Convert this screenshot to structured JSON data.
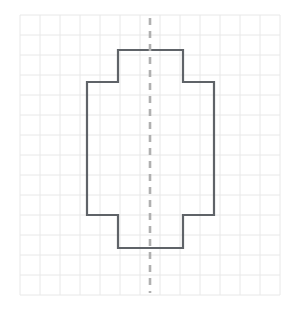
{
  "page": {
    "background_color": "#ffffff",
    "width": 293,
    "height": 309
  },
  "grid": {
    "name": "graph-paper-grid",
    "origin_x": 20,
    "origin_y": 15,
    "cell_size": 20,
    "columns": 13,
    "rows": 14,
    "line_color": "#e8e8e8",
    "line_width": 1,
    "right_x": 280,
    "bottom_y": 295
  },
  "symmetry_line": {
    "name": "vertical-line-of-symmetry",
    "orientation": "vertical",
    "x": 150,
    "y_start": 18,
    "y_end": 293,
    "color": "#b0b0b0",
    "line_width": 2.6,
    "dash_pattern": "7 6"
  },
  "figure": {
    "name": "cross-shaped-polygon",
    "stroke_color": "#5f6368",
    "stroke_width": 2.2,
    "fill": "none",
    "vertex_count": 12,
    "axis_x": 150,
    "bounds": {
      "left": 87,
      "right": 214,
      "top": 50,
      "bottom": 248
    },
    "points": "118,50 183,50 183,82 214,82 214,215 183,215 183,248 118,248 118,215 87,215 87,82 118,82",
    "vertices": [
      {
        "x": 118,
        "y": 50
      },
      {
        "x": 183,
        "y": 50
      },
      {
        "x": 183,
        "y": 82
      },
      {
        "x": 214,
        "y": 82
      },
      {
        "x": 214,
        "y": 215
      },
      {
        "x": 183,
        "y": 215
      },
      {
        "x": 183,
        "y": 248
      },
      {
        "x": 118,
        "y": 248
      },
      {
        "x": 118,
        "y": 215
      },
      {
        "x": 87,
        "y": 215
      },
      {
        "x": 87,
        "y": 82
      },
      {
        "x": 118,
        "y": 82
      }
    ]
  }
}
